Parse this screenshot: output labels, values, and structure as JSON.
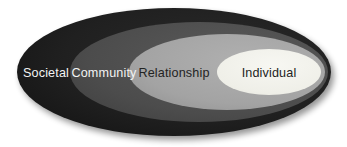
{
  "diagram": {
    "type": "nested-ellipse-model",
    "background_color": "#ffffff",
    "canvas": {
      "width": 347,
      "height": 147
    },
    "shadow_color": "#c9c9c9",
    "levels": [
      {
        "key": "societal",
        "label": "Societal",
        "order": 1,
        "fill_color": "#1f1f1f",
        "text_color": "#f3f3f3",
        "text_tone": "light",
        "ellipse": {
          "cx": 174,
          "cy": 72,
          "rx": 157,
          "ry": 64
        },
        "label_x": 46,
        "label_y": 77
      },
      {
        "key": "community",
        "label": "Community",
        "order": 2,
        "fill_color": "#4e4e4e",
        "text_color": "#f2f2f2",
        "text_tone": "light",
        "ellipse": {
          "cx": 199,
          "cy": 72,
          "rx": 129,
          "ry": 50
        },
        "label_x": 104,
        "label_y": 77
      },
      {
        "key": "relationship",
        "label": "Relationship",
        "order": 3,
        "fill_color": "#a5a5a5",
        "text_color": "#232323",
        "text_tone": "dark",
        "ellipse": {
          "cx": 227,
          "cy": 72,
          "rx": 98,
          "ry": 38
        },
        "label_x": 174,
        "label_y": 77
      },
      {
        "key": "individual",
        "label": "Individual",
        "order": 4,
        "fill_color": "#f0f0ea",
        "text_color": "#232323",
        "text_tone": "dark",
        "ellipse": {
          "cx": 269,
          "cy": 72,
          "rx": 52,
          "ry": 23
        },
        "label_x": 269,
        "label_y": 77
      }
    ]
  }
}
